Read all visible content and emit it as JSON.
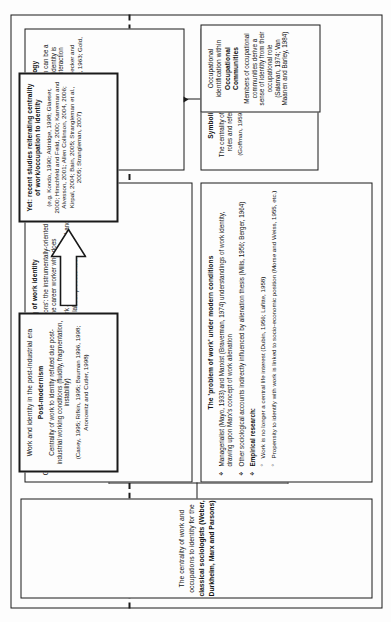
{
  "figure": {
    "title_line1": "The centrality of work and occupations to identity for the",
    "title_line2": "classical sociologists (Weber, Durkheim, Marx and Parsons)"
  },
  "boxes": {
    "problem_of_work": {
      "heading": "The 'problem of work' under modern conditions",
      "bullets": [
        "Managerialist (Mayo, 1933) and Marxist (Braverman, 1974) understandings of work identity, drawing upon Marx's concept of work alienation",
        "Other sociological accounts indirectly influenced by alienation thesis (Mills, 1956; Berger, 1964)",
        "Empirical research:"
      ],
      "bullet1_bold_a": "Managerialist",
      "bullet1_bold_b": "Marxist",
      "bullet1_bold_c": "understandings of work identity",
      "bullet3_heading": "Empirical research:",
      "sub_bullets": [
        "Work is no longer a central life interest (Dubin, 1956; Lafitte, 1958)",
        "Propensity to identify with work is linked to socio-economic position (Morse and Weiss, 1955, etc.)"
      ]
    },
    "neo_weberian": {
      "heading": "Neo-Weberian understanding of work identity",
      "body1": "Goldthorpe et al's (1968) two 'ideal types' of 'work orientations': the instrumentally-oriented worker who does not identify with his/her work, and the career worker who does",
      "body2": "Refuting assumptions of alienation thesis: origins of work alienation lies within social and cultural processes, not within the capitalist labour process itself"
    },
    "symbolic_interactionism": {
      "heading": "Symbolic Interactionism",
      "body": "The centrality of pre-defined occupational roles and reference groups to identity",
      "citation": "(Goffman, 1959, 1961, 1968; Sutherland, 1937)"
    },
    "occupational_sociology": {
      "heading": "Occupational Sociology",
      "body": "Every type of work/occupation can be a source of self-identity, since identity is constructed through social interaction",
      "citation": "(Hughes, 1951, 1958, 1971; Becker and Carper, 1956; Roy, 1960; Becker, 1963; Gold, 1964, etc.)"
    },
    "occupational_communities": {
      "heading_line1": "Occupational identification within",
      "heading_line2": "Occupational Communities",
      "body": "Members of occupational communities derive a sense of identity from their occupational role (Salaman, 1974; Van Maanen and Barley, 1984)"
    },
    "post_modernism": {
      "heading_line1": "Work and identity in the post-industrial era",
      "heading_line2": "Post-modernism",
      "body": "Centrality of work to identity refuted due post-industrial working conditions (fluidity, fragmentation, instability)",
      "citation": "(Casey, 1995; Rifkin, 1995; Bauman 1996, 1998; Aronowitz and Cutler, 1998)"
    },
    "recent_studies": {
      "heading": "Yet: recent studies reiterating centrality of work/occupation to identity",
      "citation": "(e.g. Kondo, 1990; Aldridge, 1998; Glaeser, 2000; Hirschfeld and Feild, 2000; Karreman and Alvesson, 2001; Allen Collinson, 2004, 2006; Kirpal, 2004; Bain, 2005; Strangleman et al., 2005; Strangleman, 2007)"
    }
  }
}
